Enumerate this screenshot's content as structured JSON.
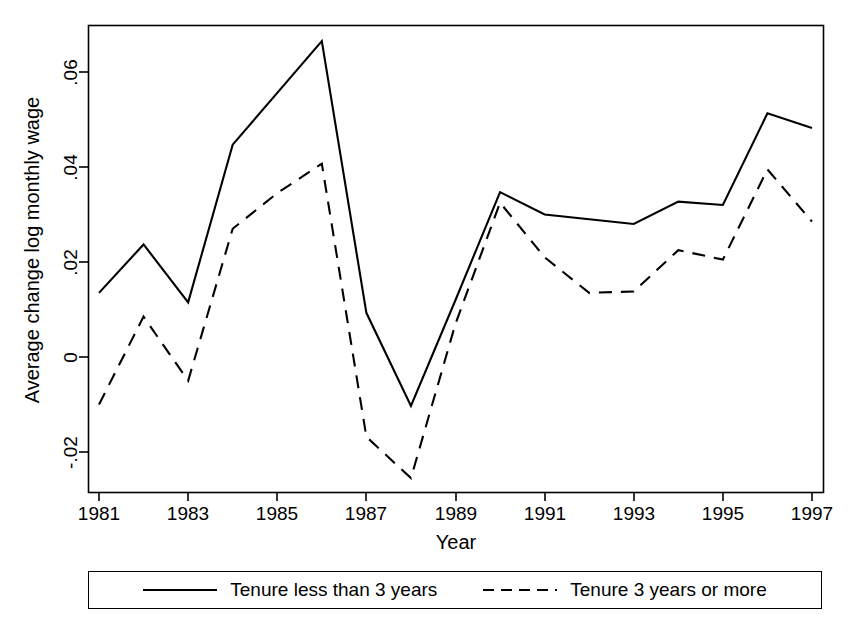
{
  "chart_data": {
    "type": "line",
    "title": "",
    "xlabel": "Year",
    "ylabel": "Average change log monthly wage",
    "x": [
      1981,
      1982,
      1983,
      1984,
      1985,
      1986,
      1987,
      1988,
      1989,
      1990,
      1991,
      1992,
      1993,
      1994,
      1995,
      1996,
      1997
    ],
    "xlim": [
      1981,
      1997
    ],
    "ylim": [
      -0.029,
      0.0705
    ],
    "xticks": [
      1981,
      1983,
      1985,
      1987,
      1989,
      1991,
      1993,
      1995,
      1997
    ],
    "xtick_labels": [
      "1981",
      "1983",
      "1985",
      "1987",
      "1989",
      "1991",
      "1993",
      "1995",
      "1997"
    ],
    "yticks": [
      0.06,
      0.04,
      0.02,
      0,
      -0.02
    ],
    "ytick_labels": [
      ".06",
      ".04",
      ".02",
      "0",
      "-.02"
    ],
    "grid": false,
    "legend_position": "below-plot",
    "series": [
      {
        "name": "Tenure less than 3 years",
        "style": "solid",
        "color": "#000000",
        "values": [
          0.0135,
          0.0237,
          0.0115,
          0.0447,
          0.0556,
          0.0665,
          0.0093,
          -0.0103,
          0.012,
          0.0347,
          0.03,
          0.029,
          0.028,
          0.0327,
          0.032,
          0.0513,
          0.0482
        ]
      },
      {
        "name": "Tenure 3 years or more",
        "style": "dashed",
        "color": "#000000",
        "values": [
          -0.01,
          0.0085,
          -0.005,
          0.027,
          0.0345,
          0.0407,
          -0.0168,
          -0.0255,
          0.007,
          0.0325,
          0.021,
          0.0135,
          0.0138,
          0.0225,
          0.0205,
          0.0395,
          0.0285
        ]
      }
    ]
  },
  "axis": {
    "ylabel": "Average change log monthly wage",
    "xlabel": "Year",
    "ytick_labels": [
      ".06",
      ".04",
      ".02",
      "0",
      "-.02"
    ],
    "xtick_labels": [
      "1981",
      "1983",
      "1985",
      "1987",
      "1989",
      "1991",
      "1993",
      "1995",
      "1997"
    ]
  },
  "legend": {
    "entries": [
      {
        "label": "Tenure less than 3 years",
        "style": "solid"
      },
      {
        "label": "Tenure 3 years or more",
        "style": "dashed"
      }
    ]
  }
}
